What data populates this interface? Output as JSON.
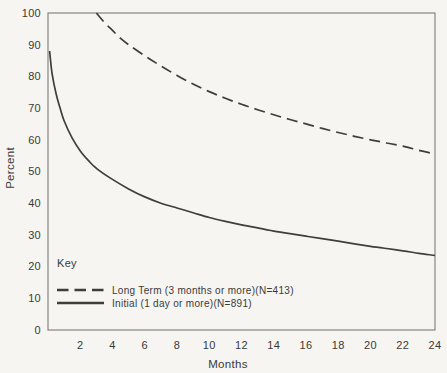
{
  "figure": {
    "background_color": "#f6f5f1",
    "line_color": "#3e3e3e",
    "axis_color": "#7a7a7a",
    "text_color": "#3a3a3a"
  },
  "chart_data": {
    "type": "line",
    "title": "",
    "xlabel": "Months",
    "ylabel": "Percent",
    "xlim": [
      0,
      24
    ],
    "ylim": [
      0,
      100
    ],
    "xticks": [
      2,
      4,
      6,
      8,
      10,
      12,
      14,
      16,
      18,
      20,
      22,
      24
    ],
    "yticks": [
      0,
      10,
      20,
      30,
      40,
      50,
      60,
      70,
      80,
      90,
      100
    ],
    "grid": false,
    "legend": {
      "title": "Key",
      "position": "inside lower-left"
    },
    "series": [
      {
        "name": "long-term",
        "label": "Long Term (3 months or more)(N=413)",
        "style": "dashed",
        "points": [
          [
            3,
            100
          ],
          [
            3.5,
            97
          ],
          [
            4,
            94.5
          ],
          [
            4.5,
            92
          ],
          [
            5,
            90
          ],
          [
            6,
            86.5
          ],
          [
            7,
            83.3
          ],
          [
            8,
            80.3
          ],
          [
            9,
            77.6
          ],
          [
            10,
            75.2
          ],
          [
            11,
            73.1
          ],
          [
            12,
            71.2
          ],
          [
            13,
            69.5
          ],
          [
            14,
            67.9
          ],
          [
            15,
            66.4
          ],
          [
            16,
            65.0
          ],
          [
            17,
            63.6
          ],
          [
            18,
            62.3
          ],
          [
            19,
            61.1
          ],
          [
            20,
            60.0
          ],
          [
            21,
            59.0
          ],
          [
            22,
            58.0
          ],
          [
            23,
            56.7
          ],
          [
            24,
            55.5
          ]
        ]
      },
      {
        "name": "initial",
        "label": "Initial (1 day or more)(N=891)",
        "style": "solid",
        "points": [
          [
            0.1,
            88
          ],
          [
            0.25,
            81
          ],
          [
            0.5,
            74.5
          ],
          [
            0.75,
            70
          ],
          [
            1,
            66
          ],
          [
            1.5,
            60.5
          ],
          [
            2,
            56.5
          ],
          [
            2.5,
            53.5
          ],
          [
            3,
            51
          ],
          [
            4,
            47.5
          ],
          [
            5,
            44.5
          ],
          [
            6,
            42
          ],
          [
            7,
            40
          ],
          [
            8,
            38.5
          ],
          [
            9,
            37
          ],
          [
            10,
            35.5
          ],
          [
            11,
            34.3
          ],
          [
            12,
            33.2
          ],
          [
            13,
            32.2
          ],
          [
            14,
            31.2
          ],
          [
            15,
            30.4
          ],
          [
            16,
            29.6
          ],
          [
            17,
            28.8
          ],
          [
            18,
            28.0
          ],
          [
            19,
            27.2
          ],
          [
            20,
            26.4
          ],
          [
            21,
            25.7
          ],
          [
            22,
            25.0
          ],
          [
            23,
            24.2
          ],
          [
            24,
            23.5
          ]
        ]
      }
    ]
  }
}
